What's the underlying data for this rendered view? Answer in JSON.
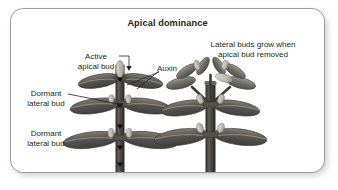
{
  "figure": {
    "title": "Apical dominance",
    "domain_label": "biology-diagram",
    "background_color": "#ffffff",
    "border_color": "#9d9d9d",
    "text_color": "#231f20"
  },
  "annotations": [
    {
      "id": "active-apical-bud",
      "text": "Active\napical bud",
      "points_to": "apical-bud-left-plant"
    },
    {
      "id": "auxin",
      "text": "Auxin",
      "points_to": "stem-auxin-flow-left-plant"
    },
    {
      "id": "dormant-lateral-bud-upper",
      "text": "Dormant\nlateral bud",
      "points_to": "lateral-bud-node-middle"
    },
    {
      "id": "dormant-lateral-bud-lower",
      "text": "Dormant\nlateral bud",
      "points_to": "lateral-bud-node-lower"
    },
    {
      "id": "lateral-buds-grow-caption",
      "text": "Lateral buds grow when\napical bud removed",
      "points_to": "right-plant"
    }
  ],
  "plants": {
    "left": {
      "name": "intact-plant-with-apical-bud",
      "apical_bud": "present",
      "lateral_buds": "dormant",
      "auxin_flow": "downward",
      "leaf_tiers": 3
    },
    "right": {
      "name": "decapitated-plant",
      "apical_bud": "removed",
      "lateral_buds": "growing",
      "auxin_flow": "none",
      "leaf_tiers": 3
    }
  },
  "palette": {
    "stem_dark": "#3c3a38",
    "stem_mid": "#55524f",
    "leaf_dark": "#4a4a46",
    "leaf_mid": "#6a6a64",
    "leaf_light": "#8d8d86",
    "bud_light": "#c9c9c2",
    "bud_outline": "#7c7c75",
    "leader_line": "#231f20"
  }
}
